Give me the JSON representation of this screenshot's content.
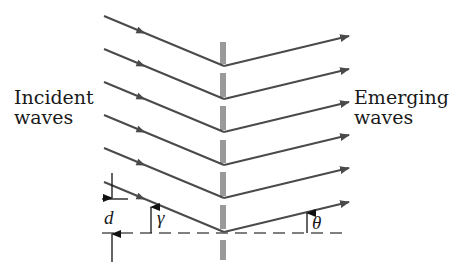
{
  "diagram": {
    "labels": {
      "incident_line1": "Incident",
      "incident_line2": "waves",
      "emerging_line1": "Emerging",
      "emerging_line2": "waves",
      "spacing": "d",
      "incident_angle": "γ",
      "emerging_angle": "θ"
    },
    "colors": {
      "ray": "#4a4a4a",
      "grating": "#9a9a9a",
      "text": "#1a1a1a"
    },
    "rays": {
      "count": 7,
      "vertex_x": 224,
      "vertex_y_first": 33,
      "spacing_px": 33
    },
    "grating_slits": 7
  }
}
